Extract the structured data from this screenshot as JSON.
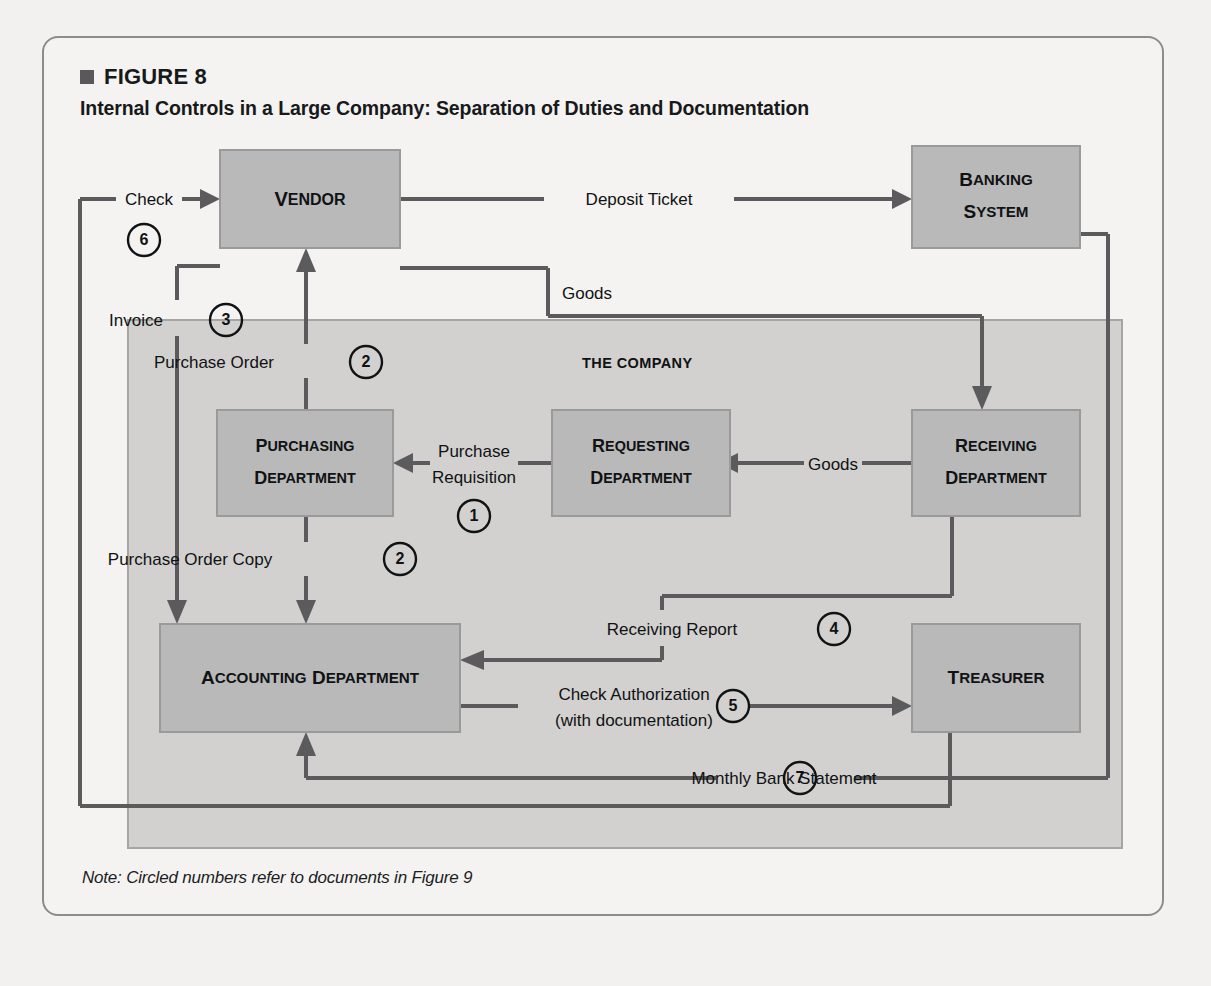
{
  "figure": {
    "number": "FIGURE 8",
    "title": "Internal Controls in a Large Company: Separation of Duties and Documentation",
    "note": "Note: Circled numbers refer to documents in Figure 9"
  },
  "company_band": {
    "label": "THE COMPANY"
  },
  "colors": {
    "box_fill": "#b9b9b9",
    "box_stroke": "#9a9a9a",
    "band_fill": "#d2d1cf",
    "line": "#5b5b5d",
    "text": "#101214",
    "card_bg": "#f4f3f1"
  },
  "chart_data": {
    "type": "diagram",
    "title": "Internal Controls in a Large Company: Separation of Duties and Documentation",
    "nodes": [
      {
        "id": "vendor",
        "label": "Vendor",
        "lines": [
          "Vendor"
        ],
        "x": 176,
        "y": 112,
        "w": 180,
        "h": 98
      },
      {
        "id": "banking",
        "label": "Banking System",
        "lines": [
          "Banking",
          "System"
        ],
        "x": 868,
        "y": 108,
        "w": 168,
        "h": 102
      },
      {
        "id": "purchasing",
        "label": "Purchasing Department",
        "lines": [
          "Purchasing",
          "Department"
        ],
        "x": 173,
        "y": 372,
        "w": 176,
        "h": 106
      },
      {
        "id": "requesting",
        "label": "Requesting Department",
        "lines": [
          "Requesting",
          "Department"
        ],
        "x": 508,
        "y": 372,
        "w": 166,
        "h": 106
      },
      {
        "id": "receiving",
        "label": "Receiving Department",
        "lines": [
          "Receiving",
          "Department"
        ],
        "x": 868,
        "y": 372,
        "w": 168,
        "h": 106
      },
      {
        "id": "accounting",
        "label": "Accounting Department",
        "lines": [
          "Accounting Department"
        ],
        "x": 116,
        "y": 586,
        "w": 300,
        "h": 108
      },
      {
        "id": "treasurer",
        "label": "Treasurer",
        "lines": [
          "Treasurer"
        ],
        "x": 868,
        "y": 586,
        "w": 168,
        "h": 108
      }
    ],
    "edges": [
      {
        "id": "deposit-ticket",
        "label": "Deposit Ticket",
        "step": null,
        "from": "vendor",
        "to": "banking"
      },
      {
        "id": "check",
        "label": "Check",
        "step": "6",
        "from": "treasurer",
        "to": "vendor"
      },
      {
        "id": "invoice",
        "label": "Invoice",
        "step": "3",
        "from": "vendor",
        "to": "accounting"
      },
      {
        "id": "goods-vendor",
        "label": "Goods",
        "step": null,
        "from": "vendor",
        "to": "receiving"
      },
      {
        "id": "purchase-order",
        "label": "Purchase Order",
        "step": "2",
        "from": "purchasing",
        "to": "vendor"
      },
      {
        "id": "purchase-requisition",
        "label": "Purchase Requisition",
        "step": "1",
        "from": "requesting",
        "to": "purchasing",
        "label_lines": [
          "Purchase",
          "Requisition"
        ]
      },
      {
        "id": "goods-receiving",
        "label": "Goods",
        "step": null,
        "from": "receiving",
        "to": "requesting"
      },
      {
        "id": "purchase-order-copy",
        "label": "Purchase Order Copy",
        "step": "2",
        "from": "purchasing",
        "to": "accounting"
      },
      {
        "id": "receiving-report",
        "label": "Receiving Report",
        "step": "4",
        "from": "receiving",
        "to": "accounting"
      },
      {
        "id": "check-authorization",
        "label": "Check Authorization (with documentation)",
        "step": "5",
        "from": "accounting",
        "to": "treasurer",
        "label_lines": [
          "Check Authorization",
          "(with documentation)"
        ]
      },
      {
        "id": "monthly-bank-statement",
        "label": "Monthly Bank Statement",
        "step": "7",
        "from": "banking",
        "to": "accounting"
      }
    ],
    "labels": {
      "deposit_ticket": "Deposit Ticket",
      "check": "Check",
      "invoice": "Invoice",
      "goods_top": "Goods",
      "goods_mid": "Goods",
      "purchase_order": "Purchase Order",
      "purchase_requisition_l1": "Purchase",
      "purchase_requisition_l2": "Requisition",
      "purchase_order_copy": "Purchase Order Copy",
      "receiving_report": "Receiving Report",
      "check_auth_l1": "Check Authorization",
      "check_auth_l2": "(with documentation)",
      "monthly_bank_statement": "Monthly Bank Statement",
      "the_company": "THE COMPANY"
    },
    "steps": {
      "s1": "1",
      "s2": "2",
      "s2b": "2",
      "s3": "3",
      "s4": "4",
      "s5": "5",
      "s6": "6",
      "s7": "7"
    },
    "node_text": {
      "vendor": "Vendor",
      "banking_1": "Banking",
      "banking_2": "System",
      "purchasing_1": "Purchasing",
      "purchasing_2": "Department",
      "requesting_1": "Requesting",
      "requesting_2": "Department",
      "receiving_1": "Receiving",
      "receiving_2": "Department",
      "accounting": "Accounting Department",
      "treasurer": "Treasurer"
    }
  }
}
